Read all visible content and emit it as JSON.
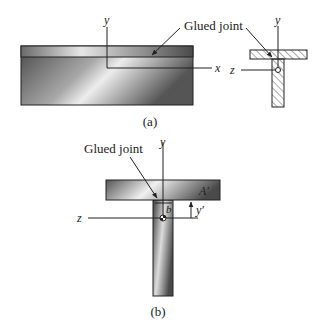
{
  "figure_a": {
    "caption": "(a)",
    "glued_joint_label": "Glued joint",
    "axis_y": "y",
    "axis_x": "x",
    "section_axis_y": "y",
    "section_axis_z": "z"
  },
  "figure_b": {
    "caption": "(b)",
    "glued_joint_label": "Glued joint",
    "axis_y": "y",
    "axis_z": "z",
    "area_label": "A′",
    "width_label": "b",
    "distance_label": "y′"
  },
  "colors": {
    "beam_dark": "#3a3a3a",
    "beam_light": "#e8e8e8",
    "line": "#222222",
    "hatch": "#444444"
  }
}
